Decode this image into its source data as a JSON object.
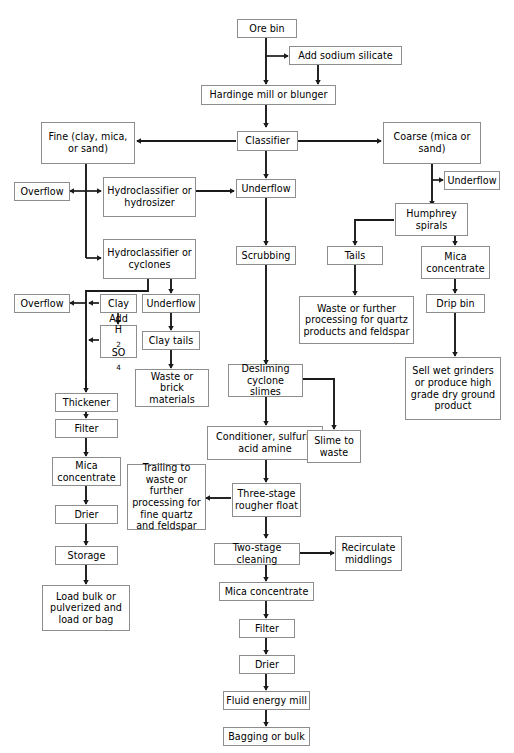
{
  "diagram": {
    "box_border_color": "#8d8d8d",
    "line_color": "#1a1a1a",
    "background": "#ffffff"
  },
  "nodes": {
    "ore_bin": "Ore bin",
    "add_sodium_silicate": "Add sodium silicate",
    "hardinge_mill": "Hardinge mill or blunger",
    "classifier": "Classifier",
    "fine": "Fine (clay, mica, or sand)",
    "coarse": "Coarse (mica or sand)",
    "overflow_1": "Overflow",
    "hydroclassifier_hydrosizer": "Hydroclassifier or hydrosizer",
    "underflow_center": "Underflow",
    "underflow_right": "Underflow",
    "humphrey_spirals": "Humphrey spirals",
    "hydroclassifier_cyclones": "Hydroclassifier or cyclones",
    "scrubbing": "Scrubbing",
    "tails": "Tails",
    "mica_concentrate_right": "Mica concentrate",
    "overflow_2": "Overflow",
    "clay": "Clay",
    "underflow_left": "Underflow",
    "waste_quartz_feldspar": "Waste or further processing for quartz products and feldspar",
    "drip_bin": "Drip bin",
    "add_h2so4_line1": "Add",
    "add_h2so4_line2_a": "H",
    "add_h2so4_line2_sub1": "2",
    "add_h2so4_line2_b": "SO",
    "add_h2so4_line2_sub2": "4",
    "clay_tails": "Clay tails",
    "thickener": "Thickener",
    "waste_or_brick": "Waste or brick materials",
    "desliming_cyclone_slimes": "Desliming cyclone slimes",
    "sell_wet_grinders": "Sell wet grinders or produce high grade dry ground product",
    "filter_left": "Filter",
    "conditioner": "Conditioner, sulfuric acid amine",
    "slime_to_waste": "Slime to waste",
    "mica_concentrate_left": "Mica concentrate",
    "trailing_to_waste": "Trailing to waste or further processing for fine quartz and feldspar",
    "three_stage_rougher_float": "Three-stage rougher float",
    "drier_left": "Drier",
    "two_stage_cleaning": "Two-stage cleaning",
    "recirculate_middlings": "Recirculate middlings",
    "storage": "Storage",
    "mica_concentrate_bottom": "Mica concentrate",
    "load_bulk": "Load bulk or pulverized and load or bag",
    "filter_bottom": "Filter",
    "drier_bottom": "Drier",
    "fluid_energy_mill": "Fluid energy mill",
    "bagging_or_bulk": "Bagging or bulk"
  },
  "flow_edges": [
    "Ore bin -> Hardinge mill or blunger",
    "Ore bin -> Add sodium silicate",
    "Add sodium silicate -> Hardinge mill or blunger",
    "Hardinge mill or blunger -> Classifier",
    "Classifier -> Fine (clay, mica, or sand)",
    "Classifier -> Coarse (mica or sand)",
    "Classifier -> Underflow",
    "Fine (clay, mica, or sand) -> Overflow",
    "Fine (clay, mica, or sand) -> Hydroclassifier or hydrosizer",
    "Fine (clay, mica, or sand) -> Hydroclassifier or cyclones",
    "Hydroclassifier or hydrosizer -> Underflow",
    "Coarse (mica or sand) -> Underflow",
    "Coarse (mica or sand) -> Humphrey spirals",
    "Humphrey spirals -> Tails",
    "Humphrey spirals -> Mica concentrate",
    "Tails -> Waste or further processing for quartz products and feldspar",
    "Mica concentrate -> Drip bin",
    "Drip bin -> Sell wet grinders or produce high grade dry ground product",
    "Hydroclassifier or cyclones -> Overflow",
    "Hydroclassifier or cyclones -> Underflow",
    "Clay -> Overflow",
    "Clay -> Add H2SO4",
    "Add H2SO4 -> Thickener",
    "Underflow -> Clay tails",
    "Clay tails -> Waste or brick materials",
    "Thickener -> Filter",
    "Filter -> Mica concentrate",
    "Mica concentrate -> Drier",
    "Drier -> Storage",
    "Storage -> Load bulk or pulverized and load or bag",
    "Underflow -> Scrubbing",
    "Scrubbing -> Desliming cyclone slimes",
    "Desliming cyclone slimes -> Conditioner, sulfuric acid amine",
    "Desliming cyclone slimes -> Slime to waste",
    "Conditioner, sulfuric acid amine -> Three-stage rougher float",
    "Three-stage rougher float -> Trailing to waste or further processing for fine quartz and feldspar",
    "Three-stage rougher float -> Two-stage cleaning",
    "Two-stage cleaning -> Recirculate middlings",
    "Two-stage cleaning -> Mica concentrate",
    "Mica concentrate -> Filter",
    "Filter -> Drier",
    "Drier -> Fluid energy mill",
    "Fluid energy mill -> Bagging or bulk"
  ]
}
